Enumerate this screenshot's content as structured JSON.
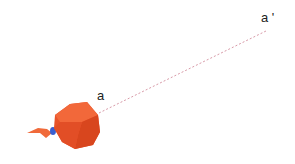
{
  "diagram": {
    "point_start_label": "a",
    "point_end_label": "a '",
    "line_style": "dashed",
    "line_color": "#d89aa8",
    "object": "red polyhedron with ribbon",
    "object_color": "#e8532a",
    "ribbon_color": "#f06a3a",
    "knot_color": "#3a5fd0"
  }
}
